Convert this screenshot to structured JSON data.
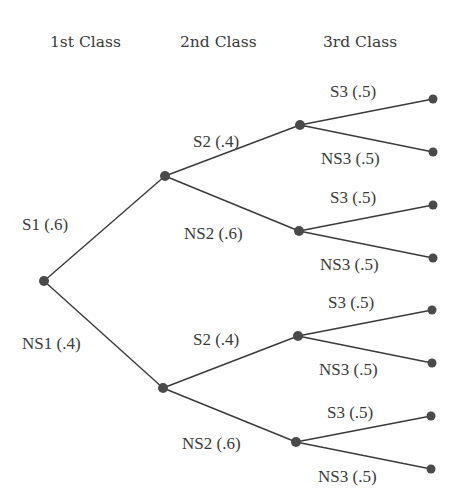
{
  "diagram": {
    "type": "probability-tree",
    "headers": [
      "1st Class",
      "2nd Class",
      "3rd Class"
    ],
    "colors": {
      "line": "#3a3a3a",
      "node": "#4a4a4a",
      "text": "#3a3a3a",
      "background": "#ffffff"
    },
    "nodes": [
      {
        "id": "root",
        "x": 44,
        "y": 281
      },
      {
        "id": "S1",
        "x": 165,
        "y": 176
      },
      {
        "id": "NS1",
        "x": 163,
        "y": 388
      },
      {
        "id": "S1S2",
        "x": 300,
        "y": 125
      },
      {
        "id": "S1NS2",
        "x": 299,
        "y": 231
      },
      {
        "id": "NS1S2",
        "x": 298,
        "y": 336
      },
      {
        "id": "NS1NS2",
        "x": 296,
        "y": 442
      },
      {
        "id": "L1",
        "x": 433,
        "y": 99
      },
      {
        "id": "L2",
        "x": 433,
        "y": 152
      },
      {
        "id": "L3",
        "x": 433,
        "y": 205
      },
      {
        "id": "L4",
        "x": 433,
        "y": 258
      },
      {
        "id": "L5",
        "x": 432,
        "y": 310
      },
      {
        "id": "L6",
        "x": 432,
        "y": 363
      },
      {
        "id": "L7",
        "x": 431,
        "y": 416
      },
      {
        "id": "L8",
        "x": 431,
        "y": 469
      }
    ],
    "edges": [
      {
        "from": "root",
        "to": "S1",
        "label": "S1 (.6)",
        "lx": 22,
        "ly": 230
      },
      {
        "from": "root",
        "to": "NS1",
        "label": "NS1 (.4)",
        "lx": 22,
        "ly": 349
      },
      {
        "from": "S1",
        "to": "S1S2",
        "label": "S2 (.4)",
        "lx": 193,
        "ly": 147
      },
      {
        "from": "S1",
        "to": "S1NS2",
        "label": "NS2 (.6)",
        "lx": 184,
        "ly": 239
      },
      {
        "from": "NS1",
        "to": "NS1S2",
        "label": "S2 (.4)",
        "lx": 193,
        "ly": 345
      },
      {
        "from": "NS1",
        "to": "NS1NS2",
        "label": "NS2 (.6)",
        "lx": 182,
        "ly": 449
      },
      {
        "from": "S1S2",
        "to": "L1",
        "label": "S3 (.5)",
        "lx": 330,
        "ly": 97
      },
      {
        "from": "S1S2",
        "to": "L2",
        "label": "NS3 (.5)",
        "lx": 321,
        "ly": 164
      },
      {
        "from": "S1NS2",
        "to": "L3",
        "label": "S3 (.5)",
        "lx": 330,
        "ly": 203
      },
      {
        "from": "S1NS2",
        "to": "L4",
        "label": "NS3 (.5)",
        "lx": 320,
        "ly": 270
      },
      {
        "from": "NS1S2",
        "to": "L5",
        "label": "S3 (.5)",
        "lx": 328,
        "ly": 308
      },
      {
        "from": "NS1S2",
        "to": "L6",
        "label": "NS3 (.5)",
        "lx": 319,
        "ly": 375
      },
      {
        "from": "NS1NS2",
        "to": "L7",
        "label": "S3 (.5)",
        "lx": 327,
        "ly": 418
      },
      {
        "from": "NS1NS2",
        "to": "L8",
        "label": "NS3 (.5)",
        "lx": 318,
        "ly": 482
      }
    ]
  }
}
